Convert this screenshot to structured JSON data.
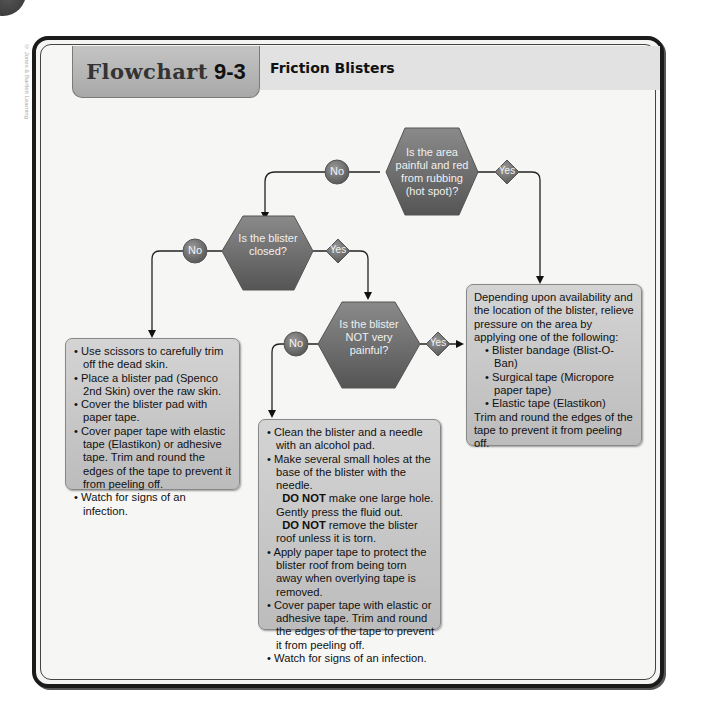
{
  "header": {
    "label": "Flowchart",
    "number": "9-3",
    "title": "Friction Blisters"
  },
  "credit": "© Jones & Bartlett Learning",
  "decisions": [
    {
      "id": "d1",
      "text": "Is the area painful and red from rubbing (hot spot)?",
      "no": "No",
      "yes": "Yes"
    },
    {
      "id": "d2",
      "text": "Is the blister closed?",
      "no": "No",
      "yes": "Yes"
    },
    {
      "id": "d3",
      "text": "Is the blister NOT very painful?",
      "no": "No",
      "yes": "Yes"
    }
  ],
  "boxes": {
    "hotspot": {
      "intro": "Depending upon availability and the location of the blister, relieve pressure on the area by applying one of the following:",
      "items": [
        "Blister bandage (Blist-O-Ban)",
        "Surgical tape (Micropore paper tape)",
        "Elastic tape (Elastikon)"
      ],
      "outro": "Trim and round the edges of the tape to prevent it from peeling off."
    },
    "open": {
      "items": [
        "Use scissors to carefully trim off the dead skin.",
        "Place a blister pad (Spenco 2nd Skin) over the raw skin.",
        "Cover the blister pad with paper tape.",
        "Cover paper tape with elastic tape (Elastikon) or adhesive tape. Trim and round the edges of the tape to prevent it from peeling off.",
        "Watch for signs of an infection."
      ]
    },
    "painful": {
      "item1": "Clean the blister and a needle with an alcohol pad.",
      "item2_a": "Make several small holes at the base of the blister with the needle.",
      "do_not": "DO NOT",
      "item2_b": "make one large hole. Gently press the fluid out.",
      "item2_c": "remove the blister roof unless it is torn.",
      "item3": "Apply paper tape to protect the blister roof from being torn away when overlying tape is removed.",
      "item4": "Cover paper tape with elastic or adhesive tape. Trim and round the edges of the tape to prevent it from peeling off.",
      "item5": "Watch for signs of an infection."
    }
  },
  "colors": {
    "node": "#6e6e6e",
    "box": "#c8c8c8",
    "frame": "#1b1b1b"
  }
}
